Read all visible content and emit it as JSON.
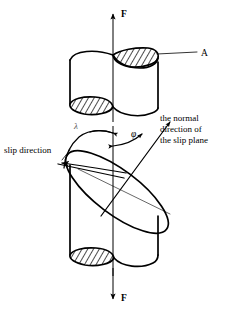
{
  "figure": {
    "background_color": "#ffffff",
    "line_color": "#000000"
  },
  "labels": {
    "force_top": "F",
    "force_bottom": "F",
    "area": "A",
    "angle_phi": "φ",
    "angle_lambda": "λ",
    "slip_direction": "slip direction",
    "normal_line1": "the normal",
    "normal_line2": "direction of",
    "normal_line3": "the slip plane"
  },
  "geometry": {
    "axis_x": 113,
    "axis_top_y": 12,
    "axis_bottom_y": 302,
    "upper_cylinder": {
      "left_x": 70,
      "right_x": 158,
      "top_y": 58,
      "bottom_y": 112
    },
    "lower_cylinder": {
      "left_x": 70,
      "right_x": 158,
      "top_y": 155,
      "bottom_y": 268
    },
    "slip_plane_ellipse": {
      "cx": 117,
      "cy": 192,
      "rx": 62,
      "ry": 22,
      "rotation_deg": 37
    },
    "normal_arrow": {
      "x1": 104,
      "y1": 212,
      "x2": 168,
      "y2": 124
    },
    "slip_direction_arrow": {
      "x1": 122,
      "y1": 177,
      "x2": 59,
      "y2": 163
    }
  },
  "annotations": {
    "phi_description": "angle between tensile axis and slip plane normal",
    "lambda_description": "angle between tensile axis and slip direction",
    "area_description": "cross-sectional area of the cylinder"
  }
}
